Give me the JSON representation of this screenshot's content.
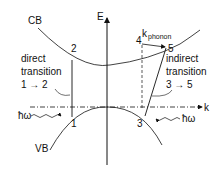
{
  "diagram": {
    "axis_energy_label": "E",
    "axis_k_label": "k",
    "conduction_band_label": "CB",
    "valence_band_label": "VB",
    "direct": {
      "line1": "direct",
      "line2": "transition",
      "line3": "1 → 2",
      "point_start": "1",
      "point_end": "2"
    },
    "indirect": {
      "line1": "indirect",
      "line2": "transition",
      "line3": "3 → 5",
      "point_start": "3",
      "point_mid": "4",
      "point_end": "5"
    },
    "phonon_label_k": "k",
    "phonon_label_sub": "phonon",
    "photon_left": "ħω",
    "photon_right": "ħω"
  }
}
